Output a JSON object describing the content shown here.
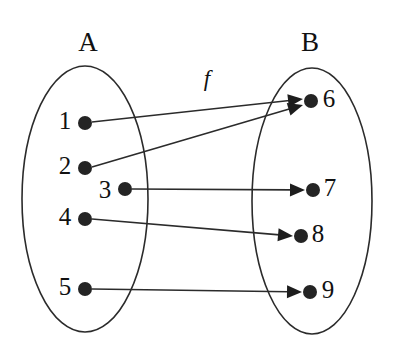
{
  "diagram": {
    "title_function_label": "f",
    "kind": "set-mapping-diagram",
    "sets": [
      {
        "id": "A",
        "label": "A",
        "label_x": 88,
        "label_y": 45,
        "ellipse": {
          "cx": 85,
          "cy": 199,
          "rx": 63,
          "ry": 133
        },
        "elements": [
          {
            "label": "1",
            "label_x": 65,
            "label_y": 123,
            "dot_x": 85,
            "dot_y": 123,
            "dot_r": 7
          },
          {
            "label": "2",
            "label_x": 65,
            "label_y": 168,
            "dot_x": 85,
            "dot_y": 168,
            "dot_r": 7
          },
          {
            "label": "3",
            "label_x": 105,
            "label_y": 192,
            "dot_x": 125,
            "dot_y": 189,
            "dot_r": 7
          },
          {
            "label": "4",
            "label_x": 65,
            "label_y": 219,
            "dot_x": 85,
            "dot_y": 219,
            "dot_r": 7
          },
          {
            "label": "5",
            "label_x": 65,
            "label_y": 289,
            "dot_x": 85,
            "dot_y": 289,
            "dot_r": 7
          }
        ]
      },
      {
        "id": "B",
        "label": "B",
        "label_x": 310,
        "label_y": 45,
        "ellipse": {
          "cx": 312,
          "cy": 201,
          "rx": 60,
          "ry": 133
        },
        "elements": [
          {
            "label": "6",
            "label_x": 329,
            "label_y": 101,
            "dot_x": 311,
            "dot_y": 101,
            "dot_r": 7
          },
          {
            "label": "7",
            "label_x": 330,
            "label_y": 190,
            "dot_x": 313,
            "dot_y": 190,
            "dot_r": 7
          },
          {
            "label": "8",
            "label_x": 318,
            "label_y": 236,
            "dot_x": 301,
            "dot_y": 236,
            "dot_r": 7
          },
          {
            "label": "9",
            "label_x": 328,
            "label_y": 292,
            "dot_x": 310,
            "dot_y": 292,
            "dot_r": 7
          }
        ]
      }
    ],
    "function": {
      "name": "f",
      "label_x": 207,
      "label_y": 81,
      "mappings": [
        {
          "from": "1",
          "to": "6",
          "x1": 92,
          "y1": 122,
          "x2": 303,
          "y2": 99
        },
        {
          "from": "2",
          "to": "6",
          "x1": 92,
          "y1": 167,
          "x2": 303,
          "y2": 105
        },
        {
          "from": "3",
          "to": "7",
          "x1": 132,
          "y1": 189,
          "x2": 305,
          "y2": 190
        },
        {
          "from": "4",
          "to": "8",
          "x1": 92,
          "y1": 219,
          "x2": 293,
          "y2": 236
        },
        {
          "from": "5",
          "to": "9",
          "x1": 92,
          "y1": 289,
          "x2": 302,
          "y2": 292
        }
      ]
    }
  }
}
